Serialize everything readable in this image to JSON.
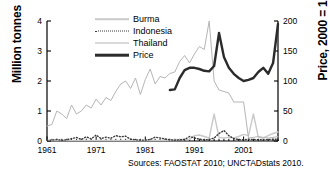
{
  "chart_data": {
    "type": "line",
    "title": "",
    "xlabel": "",
    "ylabel": "Million tonnes",
    "y2label": "Price, 2000 = 100",
    "xlim": [
      1961,
      2008
    ],
    "ylim": [
      0,
      4
    ],
    "y2lim": [
      0,
      200
    ],
    "grid": false,
    "legend_position": "top-center",
    "xticks": [
      "1961",
      "1971",
      "1981",
      "1991",
      "2001"
    ],
    "xtick_values": [
      1961,
      1971,
      1981,
      1991,
      2001
    ],
    "yticks_left": [
      "0",
      "1",
      "2",
      "3",
      "4"
    ],
    "ytick_values_left": [
      0,
      1,
      2,
      3,
      4
    ],
    "yticks_right": [
      "0",
      "50",
      "100",
      "150",
      "200"
    ],
    "ytick_values_right": [
      0,
      50,
      100,
      150,
      200
    ],
    "source_note": "Sources: FAOSTAT 2010; UNCTADstats 2010.",
    "colors": {
      "burma": "#c9c9c9",
      "indonesia": "#3a3a3a",
      "thailand": "#b5b5b5",
      "price": "#2b2b2b",
      "axis": "#000000",
      "background": "#ffffff"
    },
    "series": [
      {
        "name": "Burma",
        "axis": "left",
        "style": "solid-light",
        "x": [
          1961,
          1962,
          1963,
          1964,
          1965,
          1966,
          1967,
          1968,
          1969,
          1970,
          1971,
          1972,
          1973,
          1974,
          1975,
          1976,
          1977,
          1978,
          1979,
          1980,
          1981,
          1982,
          1983,
          1984,
          1985,
          1986,
          1987,
          1988,
          1989,
          1990,
          1991,
          1992,
          1993,
          1994,
          1995,
          1996,
          1997,
          1998,
          1999,
          2000,
          2001,
          2002,
          2003,
          2004,
          2005,
          2006,
          2007,
          2008
        ],
        "values": [
          0.02,
          0.02,
          0.02,
          0.02,
          0.02,
          0.02,
          0.02,
          0.02,
          0.02,
          0.02,
          0.02,
          0.02,
          0.02,
          0.02,
          0.02,
          0.02,
          0.02,
          0.02,
          0.02,
          0.02,
          0.02,
          0.02,
          0.02,
          0.02,
          0.02,
          0.03,
          0.04,
          0.04,
          0.05,
          0.05,
          0.18,
          0.2,
          0.15,
          0.1,
          0.9,
          0.12,
          0.1,
          0.12,
          0.1,
          0.15,
          0.22,
          0.18,
          0.9,
          0.12,
          0.1,
          0.18,
          0.25,
          0.3
        ]
      },
      {
        "name": "Indonesia",
        "axis": "left",
        "style": "dotted",
        "x": [
          1961,
          1962,
          1963,
          1964,
          1965,
          1966,
          1967,
          1968,
          1969,
          1970,
          1971,
          1972,
          1973,
          1974,
          1975,
          1976,
          1977,
          1978,
          1979,
          1980,
          1981,
          1982,
          1983,
          1984,
          1985,
          1986,
          1987,
          1988,
          1989,
          1990,
          1991,
          1992,
          1993,
          1994,
          1995,
          1996,
          1997,
          1998,
          1999,
          2000,
          2001,
          2002,
          2003,
          2004,
          2005,
          2006,
          2007,
          2008
        ],
        "values": [
          0.02,
          0.03,
          0.05,
          0.02,
          0.04,
          0.08,
          0.12,
          0.05,
          0.14,
          0.07,
          0.2,
          0.08,
          0.13,
          0.09,
          0.18,
          0.14,
          0.16,
          0.06,
          0.04,
          0.03,
          0.03,
          0.05,
          0.13,
          0.1,
          0.07,
          0.04,
          0.03,
          0.04,
          0.05,
          0.15,
          0.1,
          0.06,
          0.04,
          0.05,
          0.1,
          0.25,
          0.35,
          0.18,
          0.08,
          0.05,
          0.04,
          0.06,
          0.05,
          0.04,
          0.04,
          0.05,
          0.06,
          0.06
        ]
      },
      {
        "name": "Thailand",
        "axis": "left",
        "style": "solid-thin",
        "x": [
          1961,
          1962,
          1963,
          1964,
          1965,
          1966,
          1967,
          1968,
          1969,
          1970,
          1971,
          1972,
          1973,
          1974,
          1975,
          1976,
          1977,
          1978,
          1979,
          1980,
          1981,
          1982,
          1983,
          1984,
          1985,
          1986,
          1987,
          1988,
          1989,
          1990,
          1991,
          1992,
          1993,
          1994,
          1995,
          1996,
          1997,
          1998,
          1999,
          2000,
          2001,
          2002,
          2003,
          2004,
          2005,
          2006,
          2007,
          2008
        ],
        "values": [
          0.5,
          0.55,
          1.0,
          0.9,
          0.75,
          1.2,
          0.9,
          1.0,
          1.2,
          1.1,
          1.4,
          1.2,
          1.45,
          1.35,
          1.65,
          1.9,
          2.0,
          1.75,
          2.1,
          1.55,
          2.05,
          2.4,
          1.9,
          2.15,
          2.1,
          2.25,
          2.3,
          2.65,
          2.85,
          2.6,
          2.9,
          3.15,
          3.05,
          4.0,
          2.0,
          1.7,
          1.65,
          1.6,
          1.3,
          1.3,
          1.3,
          0.1,
          0.12,
          0.15,
          0.12,
          0.1,
          0.12,
          0.15
        ]
      },
      {
        "name": "Price",
        "axis": "right",
        "style": "solid-thick",
        "x": [
          1986,
          1987,
          1988,
          1989,
          1990,
          1991,
          1992,
          1993,
          1994,
          1995,
          1996,
          1997,
          1998,
          1999,
          2000,
          2001,
          2002,
          2003,
          2004,
          2005,
          2006,
          2007,
          2008
        ],
        "values": [
          85,
          86,
          105,
          118,
          122,
          122,
          120,
          117,
          116,
          125,
          180,
          140,
          122,
          112,
          105,
          100,
          102,
          105,
          115,
          122,
          112,
          130,
          195
        ]
      }
    ]
  },
  "legend": {
    "items": [
      {
        "label": "Burma",
        "key": "burma"
      },
      {
        "label": "Indonesia",
        "key": "indonesia"
      },
      {
        "label": "Thailand",
        "key": "thailand"
      },
      {
        "label": "Price",
        "key": "price"
      }
    ]
  },
  "axes": {
    "left_title": "Million tonnes",
    "right_title": "Price, 2000 = 100"
  },
  "footer": {
    "source": "Sources: FAOSTAT 2010; UNCTADstats 2010."
  }
}
